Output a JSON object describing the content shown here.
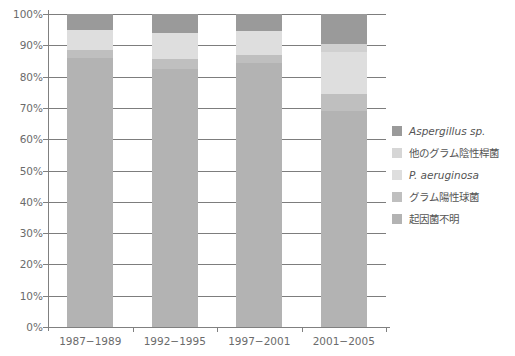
{
  "chart_data": {
    "type": "bar",
    "subtype": "stacked-100-percent",
    "title": "",
    "xlabel": "",
    "ylabel": "",
    "ylim": [
      0,
      100
    ],
    "ytick_labels": [
      "0%",
      "10%",
      "20%",
      "30%",
      "40%",
      "50%",
      "60%",
      "70%",
      "80%",
      "90%",
      "100%"
    ],
    "ytick_values": [
      0,
      10,
      20,
      30,
      40,
      50,
      60,
      70,
      80,
      90,
      100
    ],
    "grid": true,
    "legend_position": "right",
    "categories": [
      "1987−1989",
      "1992−1995",
      "1997−2001",
      "2001−2005"
    ],
    "series": [
      {
        "name": "起因菌不明",
        "color": "#b3b3b3",
        "values": [
          86.0,
          82.5,
          84.5,
          69.0
        ]
      },
      {
        "name": "グラム陽性球菌",
        "color": "#bfbfbf",
        "values": [
          2.5,
          3.0,
          2.5,
          5.5
        ]
      },
      {
        "name": "P. aeruginosa",
        "color": "#dedede",
        "values": [
          6.5,
          8.5,
          7.5,
          13.5
        ]
      },
      {
        "name": "他のグラム陰性桿菌",
        "color": "#d0d0d0",
        "values": [
          0.0,
          0.0,
          0.0,
          2.5
        ]
      },
      {
        "name": "Aspergillus sp.",
        "color": "#9a9a9a",
        "values": [
          5.0,
          6.0,
          5.5,
          9.5
        ]
      }
    ]
  },
  "legend": {
    "items": [
      {
        "label": "Aspergillus sp.",
        "color": "#9a9a9a",
        "italic": true
      },
      {
        "label": "他のグラム陰性桿菌",
        "color": "#d6d6d6",
        "italic": false
      },
      {
        "label": "P. aeruginosa",
        "color": "#dedede",
        "italic": true
      },
      {
        "label": "グラム陽性球菌",
        "color": "#bfbfbf",
        "italic": false
      },
      {
        "label": "起因菌不明",
        "color": "#b3b3b3",
        "italic": false
      }
    ]
  }
}
